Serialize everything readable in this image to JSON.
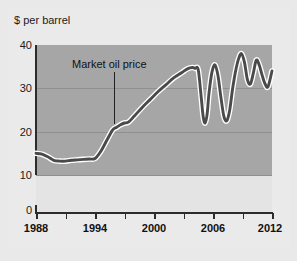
{
  "figure": {
    "ylabel": "$ per barrel",
    "annotation_label": "Market oil price"
  },
  "colors": {
    "plot_background": "#a6a6a6",
    "lower_background": "#e4e4e4",
    "page_background": "#eaeaea",
    "line": "#4a4a4a",
    "line_halo": "#ffffff",
    "gridline": "#8f8f8f",
    "axis": "#2b2b2b",
    "text": "#111111"
  },
  "chart_data": {
    "type": "line",
    "title": "",
    "subtitle": "",
    "xlabel": "",
    "ylabel": "$ per barrel",
    "xlim": [
      1988,
      2012
    ],
    "ylim": [
      10,
      40
    ],
    "y_axis_break": true,
    "y_axis_break_note": "Axis shows 0 below a break; plotted range begins at 10",
    "grid": true,
    "grid_axis": "y",
    "legend": false,
    "legend_position": "none",
    "yticks": [
      0,
      10,
      20,
      30,
      40
    ],
    "ytick_labels": [
      "0",
      "10",
      "20",
      "30",
      "40"
    ],
    "xticks": [
      1988,
      1991,
      1994,
      1997,
      2000,
      2003,
      2006,
      2009,
      2012
    ],
    "xtick_labels": [
      "1988",
      "",
      "1994",
      "",
      "2000",
      "",
      "2006",
      "",
      "2012"
    ],
    "xtick_labels_shown": [
      "1988",
      "1994",
      "2000",
      "2006",
      "2012"
    ],
    "annotations": [
      {
        "text": "Market oil price",
        "points_to_x": 1997,
        "points_to_y": 22
      }
    ],
    "series": [
      {
        "name": "Market oil price",
        "x": [
          1988,
          1988.6,
          1989.2,
          1989.8,
          1990.4,
          1991,
          1991.6,
          1992.2,
          1992.8,
          1993.4,
          1994,
          1994.6,
          1995.2,
          1995.8,
          1996.2,
          1996.6,
          1997,
          1997.4,
          1998,
          1998.8,
          1999.6,
          2000.4,
          2001.2,
          2002,
          2002.8,
          2003.4,
          2003.9,
          2004.2,
          2004.5,
          2004.8,
          2005,
          2005.2,
          2005.4,
          2005.6,
          2005.9,
          2006.2,
          2006.5,
          2006.8,
          2007.1,
          2007.4,
          2007.7,
          2008,
          2008.3,
          2008.6,
          2008.9,
          2009.2,
          2009.5,
          2009.8,
          2010.1,
          2010.4,
          2010.7,
          2011,
          2011.3,
          2011.6,
          2012
        ],
        "y": [
          15.0,
          14.8,
          14.2,
          13.4,
          13.2,
          13.2,
          13.4,
          13.5,
          13.6,
          13.7,
          13.8,
          15.5,
          18.0,
          20.4,
          21.0,
          21.6,
          22.0,
          22.2,
          23.6,
          25.6,
          27.4,
          29.2,
          30.8,
          32.4,
          33.6,
          34.5,
          34.8,
          34.6,
          34.3,
          28.0,
          23.5,
          22.0,
          24.0,
          29.0,
          33.8,
          35.4,
          33.0,
          28.0,
          23.6,
          22.5,
          25.0,
          30.0,
          34.0,
          36.8,
          38.0,
          36.0,
          32.0,
          31.0,
          33.5,
          36.5,
          35.4,
          33.0,
          31.0,
          30.4,
          34.0
        ]
      }
    ]
  }
}
